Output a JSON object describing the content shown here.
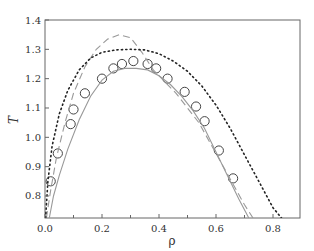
{
  "chart_data": {
    "type": "line",
    "title": "",
    "xlabel": "ρ",
    "ylabel": "T",
    "xlim": [
      0.0,
      0.895
    ],
    "ylim": [
      0.725,
      1.4
    ],
    "xticks": [
      0.0,
      0.2,
      0.4,
      0.6,
      0.8
    ],
    "xtick_labels": [
      "0.0",
      "0.2",
      "0.4",
      "0.6",
      "0.8"
    ],
    "x_minor_ticks": [
      0.1,
      0.3,
      0.5,
      0.7
    ],
    "yticks": [
      0.8,
      0.9,
      1.0,
      1.1,
      1.2,
      1.3,
      1.4
    ],
    "ytick_labels": [
      "0.8",
      "0.9",
      "1.0",
      "1.1",
      "1.2",
      "1.3",
      "1.4"
    ],
    "grid": false,
    "legend": null,
    "series": [
      {
        "name": "simulation (circles)",
        "style": "markers-open-circle",
        "x": [
          0.02,
          0.045,
          0.09,
          0.1,
          0.14,
          0.2,
          0.24,
          0.27,
          0.31,
          0.36,
          0.39,
          0.43,
          0.49,
          0.53,
          0.56,
          0.61,
          0.66
        ],
        "y": [
          0.85,
          0.945,
          1.045,
          1.095,
          1.15,
          1.2,
          1.235,
          1.25,
          1.26,
          1.25,
          1.235,
          1.2,
          1.155,
          1.105,
          1.055,
          0.955,
          0.86
        ]
      },
      {
        "name": "theory (solid)",
        "style": "solid",
        "x": [
          0.015,
          0.03,
          0.05,
          0.08,
          0.12,
          0.16,
          0.2,
          0.24,
          0.28,
          0.32,
          0.36,
          0.4,
          0.44,
          0.48,
          0.52,
          0.56,
          0.6,
          0.64,
          0.68,
          0.715
        ],
        "y": [
          0.725,
          0.8,
          0.87,
          0.96,
          1.06,
          1.14,
          1.195,
          1.225,
          1.235,
          1.235,
          1.23,
          1.21,
          1.18,
          1.14,
          1.09,
          1.03,
          0.95,
          0.87,
          0.79,
          0.725
        ]
      },
      {
        "name": "theory (dashed)",
        "style": "dashed",
        "x": [
          0.005,
          0.02,
          0.04,
          0.07,
          0.1,
          0.14,
          0.18,
          0.22,
          0.26,
          0.3,
          0.34,
          0.38,
          0.42,
          0.46,
          0.5,
          0.54,
          0.58,
          0.62,
          0.66,
          0.7,
          0.73
        ],
        "y": [
          0.725,
          0.82,
          0.93,
          1.05,
          1.15,
          1.24,
          1.3,
          1.335,
          1.35,
          1.34,
          1.29,
          1.23,
          1.19,
          1.15,
          1.1,
          1.05,
          0.98,
          0.91,
          0.84,
          0.77,
          0.725
        ]
      },
      {
        "name": "theory (dotted)",
        "style": "dotted",
        "x": [
          0.002,
          0.01,
          0.025,
          0.05,
          0.08,
          0.12,
          0.16,
          0.2,
          0.25,
          0.3,
          0.35,
          0.4,
          0.45,
          0.5,
          0.55,
          0.6,
          0.65,
          0.7,
          0.75,
          0.8,
          0.83
        ],
        "y": [
          0.725,
          0.85,
          0.97,
          1.08,
          1.16,
          1.23,
          1.27,
          1.29,
          1.298,
          1.3,
          1.298,
          1.285,
          1.26,
          1.225,
          1.175,
          1.11,
          1.03,
          0.94,
          0.85,
          0.76,
          0.725
        ]
      }
    ]
  },
  "style": {
    "line_color": "#555555",
    "solid_color": "#999999",
    "dashed_color": "#999999",
    "dotted_color": "#222222",
    "marker_color": "#444444",
    "axis_color": "#666666"
  }
}
